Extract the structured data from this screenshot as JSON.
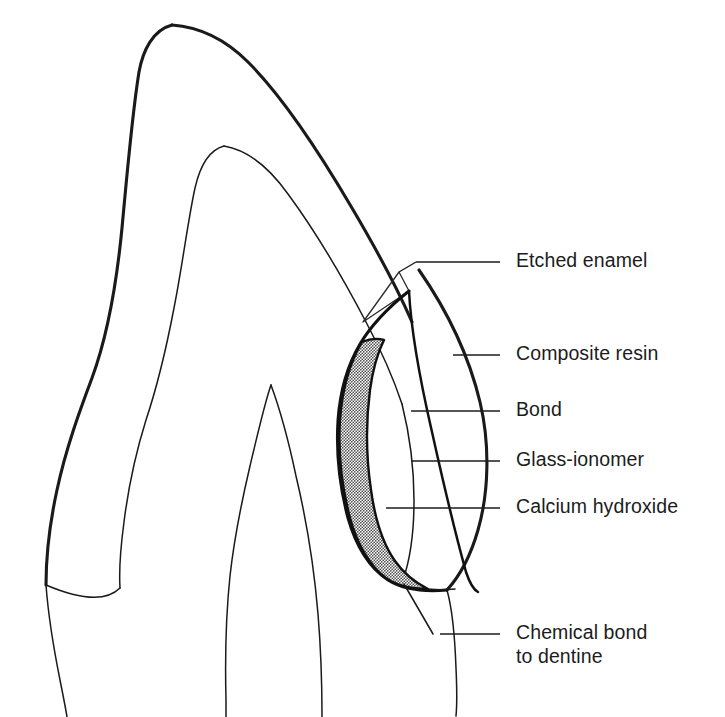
{
  "figure": {
    "background_color": "#ffffff",
    "ink_color": "#1a1a1a",
    "stipple_fill_color": "#8a8a8a",
    "width": 725,
    "height": 717
  },
  "labels": [
    {
      "id": "etched-enamel",
      "text": "Etched enamel",
      "text_x": 516,
      "text_y": 262,
      "leader": "M 416 262 L 500 262 M 416 262 L 399 272 L 409 291"
    },
    {
      "id": "composite-resin",
      "text": "Composite resin",
      "text_x": 516,
      "text_y": 355,
      "leader": "M 453 355 L 500 355"
    },
    {
      "id": "bond",
      "text": "Bond",
      "text_x": 516,
      "text_y": 411,
      "leader": "M 411 411 L 500 411"
    },
    {
      "id": "glass-ionomer",
      "text": "Glass-ionomer",
      "text_x": 516,
      "text_y": 461,
      "leader": "M 411 461 L 500 461"
    },
    {
      "id": "calcium-hydroxide",
      "text": "Calcium hydroxide",
      "text_x": 516,
      "text_y": 508,
      "leader": "M 386 508 L 500 508"
    },
    {
      "id": "chemical-bond-to-dentine",
      "text_line_1": "Chemical bond",
      "text_line_2": "to dentine",
      "text_x": 516,
      "text_y": 634,
      "text_y2": 658,
      "leader": "M 440 634 L 500 634 M 440 634 L 433 586"
    }
  ],
  "anatomy": {
    "enamel_outline_name": "enamel-outline",
    "dentine_outline_name": "dentine-outline",
    "pulp_horn_name": "pulp-chamber-outline",
    "root_name": "root-outline"
  },
  "restoration": {
    "composite_name": "composite-resin-region",
    "bond_line_name": "bond-interface-line",
    "glass_ionomer_name": "glass-ionomer-region",
    "calcium_hydroxide_name": "calcium-hydroxide-lining",
    "bevel_name": "enamel-bevel"
  }
}
